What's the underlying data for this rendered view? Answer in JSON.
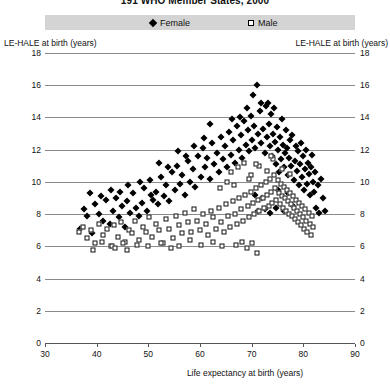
{
  "chart_data": {
    "type": "scatter",
    "title": "191 WHO Member States, 2000",
    "xlabel": "Life expectancy at birth (years)",
    "ylabel_left": "LE-HALE at birth (years)",
    "ylabel_right": "LE-HALE at birth (years)",
    "xlim": [
      30,
      90
    ],
    "ylim": [
      0,
      18
    ],
    "xticks": [
      30,
      40,
      50,
      60,
      70,
      80,
      90
    ],
    "yticks": [
      0,
      2,
      4,
      6,
      8,
      10,
      12,
      14,
      16,
      18
    ],
    "grid": "horizontal",
    "legend_position": "top",
    "legend": [
      {
        "label": "Female",
        "marker": "filled-diamond",
        "color": "#000000"
      },
      {
        "label": "Male",
        "marker": "open-square",
        "color": "#000000"
      }
    ],
    "series": [
      {
        "name": "Female",
        "marker": "filled-diamond",
        "points": [
          [
            37.5,
            8.3
          ],
          [
            38.2,
            7.9
          ],
          [
            39.0,
            6.8
          ],
          [
            39.6,
            8.6
          ],
          [
            40.4,
            8.0
          ],
          [
            41.2,
            7.6
          ],
          [
            41.9,
            8.9
          ],
          [
            42.5,
            7.4
          ],
          [
            43.1,
            8.2
          ],
          [
            43.8,
            9.0
          ],
          [
            44.3,
            7.8
          ],
          [
            44.9,
            8.5
          ],
          [
            45.4,
            7.2
          ],
          [
            45.9,
            8.8
          ],
          [
            46.5,
            8.1
          ],
          [
            47.0,
            9.3
          ],
          [
            47.6,
            8.4
          ],
          [
            48.1,
            7.9
          ],
          [
            48.7,
            8.7
          ],
          [
            49.2,
            9.6
          ],
          [
            49.8,
            8.2
          ],
          [
            50.3,
            10.1
          ],
          [
            50.9,
            8.9
          ],
          [
            51.4,
            9.4
          ],
          [
            51.9,
            8.6
          ],
          [
            52.4,
            10.3
          ],
          [
            53.0,
            9.1
          ],
          [
            53.5,
            9.8
          ],
          [
            54.0,
            8.8
          ],
          [
            54.6,
            10.6
          ],
          [
            55.1,
            9.5
          ],
          [
            55.6,
            11.0
          ],
          [
            56.1,
            9.9
          ],
          [
            56.6,
            10.4
          ],
          [
            57.1,
            9.2
          ],
          [
            57.6,
            11.3
          ],
          [
            58.1,
            10.0
          ],
          [
            58.6,
            10.8
          ],
          [
            59.1,
            9.7
          ],
          [
            59.6,
            11.6
          ],
          [
            60.1,
            10.3
          ],
          [
            60.5,
            12.1
          ],
          [
            61.0,
            10.9
          ],
          [
            61.4,
            11.5
          ],
          [
            61.9,
            10.2
          ],
          [
            62.3,
            12.4
          ],
          [
            62.8,
            11.1
          ],
          [
            63.2,
            11.8
          ],
          [
            63.6,
            10.6
          ],
          [
            64.0,
            12.8
          ],
          [
            64.4,
            11.4
          ],
          [
            64.8,
            12.2
          ],
          [
            65.2,
            10.9
          ],
          [
            65.6,
            13.1
          ],
          [
            66.0,
            11.7
          ],
          [
            66.4,
            12.6
          ],
          [
            66.8,
            11.2
          ],
          [
            67.1,
            13.5
          ],
          [
            67.5,
            12.0
          ],
          [
            67.9,
            12.9
          ],
          [
            68.2,
            11.5
          ],
          [
            68.6,
            13.8
          ],
          [
            68.9,
            12.3
          ],
          [
            69.2,
            13.2
          ],
          [
            69.5,
            11.9
          ],
          [
            69.8,
            14.1
          ],
          [
            70.1,
            12.6
          ],
          [
            70.4,
            13.5
          ],
          [
            70.7,
            12.1
          ],
          [
            71.0,
            16.0
          ],
          [
            71.3,
            13.0
          ],
          [
            71.6,
            14.4
          ],
          [
            71.9,
            12.4
          ],
          [
            72.2,
            13.3
          ],
          [
            72.5,
            11.8
          ],
          [
            72.8,
            14.7
          ],
          [
            73.0,
            12.8
          ],
          [
            73.3,
            13.6
          ],
          [
            73.5,
            12.2
          ],
          [
            73.8,
            14.2
          ],
          [
            74.0,
            11.6
          ],
          [
            74.2,
            13.0
          ],
          [
            74.5,
            12.5
          ],
          [
            74.7,
            11.1
          ],
          [
            74.9,
            13.4
          ],
          [
            75.1,
            12.0
          ],
          [
            75.3,
            10.6
          ],
          [
            75.5,
            12.8
          ],
          [
            75.7,
            11.4
          ],
          [
            75.9,
            13.9
          ],
          [
            76.1,
            12.3
          ],
          [
            76.3,
            10.9
          ],
          [
            76.5,
            11.8
          ],
          [
            76.7,
            13.2
          ],
          [
            76.9,
            12.1
          ],
          [
            77.1,
            10.4
          ],
          [
            77.3,
            11.5
          ],
          [
            77.5,
            12.6
          ],
          [
            77.7,
            11.0
          ],
          [
            77.9,
            12.9
          ],
          [
            78.1,
            10.1
          ],
          [
            78.3,
            11.3
          ],
          [
            78.5,
            12.2
          ],
          [
            78.7,
            10.7
          ],
          [
            78.9,
            11.9
          ],
          [
            79.1,
            9.8
          ],
          [
            79.3,
            11.1
          ],
          [
            79.5,
            12.4
          ],
          [
            79.7,
            10.3
          ],
          [
            79.9,
            11.6
          ],
          [
            80.1,
            9.5
          ],
          [
            80.3,
            10.8
          ],
          [
            80.5,
            12.0
          ],
          [
            80.7,
            9.9
          ],
          [
            80.9,
            11.2
          ],
          [
            81.1,
            10.5
          ],
          [
            81.3,
            9.2
          ],
          [
            81.5,
            10.9
          ],
          [
            81.7,
            11.7
          ],
          [
            81.9,
            10.0
          ],
          [
            82.1,
            9.4
          ],
          [
            82.3,
            10.6
          ],
          [
            82.5,
            8.4
          ],
          [
            82.8,
            9.8
          ],
          [
            83.1,
            8.1
          ],
          [
            83.4,
            10.2
          ],
          [
            83.8,
            9.0
          ],
          [
            84.2,
            8.2
          ],
          [
            70.3,
            15.4
          ],
          [
            71.8,
            14.9
          ],
          [
            69.0,
            14.6
          ],
          [
            67.8,
            14.0
          ],
          [
            66.2,
            13.9
          ],
          [
            73.2,
            14.9
          ],
          [
            74.4,
            14.6
          ],
          [
            62.0,
            13.6
          ],
          [
            60.8,
            12.7
          ],
          [
            58.9,
            12.2
          ],
          [
            57.3,
            11.6
          ],
          [
            55.8,
            11.9
          ],
          [
            53.8,
            10.9
          ],
          [
            52.0,
            11.2
          ],
          [
            50.5,
            9.2
          ],
          [
            48.4,
            10.0
          ],
          [
            46.0,
            9.8
          ],
          [
            44.6,
            9.4
          ],
          [
            42.8,
            9.5
          ],
          [
            40.8,
            9.1
          ],
          [
            38.8,
            9.3
          ],
          [
            36.8,
            7.1
          ],
          [
            71.2,
            8.2
          ],
          [
            72.6,
            8.3
          ],
          [
            73.6,
            8.1
          ],
          [
            74.8,
            8.4
          ],
          [
            76.2,
            8.2
          ],
          [
            78.0,
            8.5
          ],
          [
            70.6,
            9.2
          ],
          [
            72.0,
            9.0
          ],
          [
            75.0,
            9.5
          ],
          [
            77.0,
            9.3
          ]
        ]
      },
      {
        "name": "Male",
        "marker": "open-square",
        "points": [
          [
            36.5,
            6.9
          ],
          [
            37.4,
            7.2
          ],
          [
            38.1,
            6.5
          ],
          [
            38.9,
            7.0
          ],
          [
            39.7,
            6.2
          ],
          [
            40.5,
            7.4
          ],
          [
            41.3,
            6.7
          ],
          [
            42.0,
            7.1
          ],
          [
            42.7,
            6.0
          ],
          [
            43.4,
            7.3
          ],
          [
            44.1,
            6.6
          ],
          [
            44.8,
            7.5
          ],
          [
            45.5,
            6.3
          ],
          [
            46.2,
            7.0
          ],
          [
            46.9,
            6.8
          ],
          [
            47.5,
            7.6
          ],
          [
            48.2,
            6.4
          ],
          [
            48.9,
            7.2
          ],
          [
            49.5,
            6.9
          ],
          [
            50.2,
            7.8
          ],
          [
            50.8,
            6.6
          ],
          [
            51.5,
            7.4
          ],
          [
            52.1,
            7.0
          ],
          [
            52.8,
            6.2
          ],
          [
            53.4,
            7.7
          ],
          [
            54.0,
            7.1
          ],
          [
            54.7,
            6.5
          ],
          [
            55.3,
            7.9
          ],
          [
            55.9,
            7.3
          ],
          [
            56.5,
            6.8
          ],
          [
            57.1,
            8.1
          ],
          [
            57.7,
            7.5
          ],
          [
            58.3,
            6.9
          ],
          [
            58.9,
            8.3
          ],
          [
            59.4,
            7.6
          ],
          [
            60.0,
            7.0
          ],
          [
            60.5,
            8.0
          ],
          [
            61.1,
            7.4
          ],
          [
            61.6,
            6.7
          ],
          [
            62.1,
            8.2
          ],
          [
            62.6,
            7.8
          ],
          [
            63.1,
            7.1
          ],
          [
            63.6,
            8.4
          ],
          [
            64.1,
            7.5
          ],
          [
            64.6,
            6.9
          ],
          [
            65.0,
            8.6
          ],
          [
            65.5,
            7.9
          ],
          [
            65.9,
            7.2
          ],
          [
            66.4,
            8.8
          ],
          [
            66.8,
            8.0
          ],
          [
            67.2,
            7.4
          ],
          [
            67.6,
            9.0
          ],
          [
            68.0,
            8.3
          ],
          [
            68.4,
            7.6
          ],
          [
            68.8,
            9.2
          ],
          [
            69.2,
            8.5
          ],
          [
            69.5,
            7.8
          ],
          [
            69.9,
            9.4
          ],
          [
            70.2,
            8.7
          ],
          [
            70.5,
            8.0
          ],
          [
            70.9,
            9.6
          ],
          [
            71.2,
            8.9
          ],
          [
            71.5,
            8.2
          ],
          [
            71.8,
            9.8
          ],
          [
            72.1,
            9.0
          ],
          [
            72.4,
            8.4
          ],
          [
            72.7,
            10.0
          ],
          [
            73.0,
            9.2
          ],
          [
            73.3,
            8.5
          ],
          [
            73.5,
            10.2
          ],
          [
            73.8,
            9.4
          ],
          [
            74.0,
            8.7
          ],
          [
            74.3,
            10.4
          ],
          [
            74.5,
            9.6
          ],
          [
            74.7,
            8.9
          ],
          [
            75.0,
            10.1
          ],
          [
            75.2,
            9.3
          ],
          [
            75.4,
            8.6
          ],
          [
            75.6,
            9.9
          ],
          [
            75.8,
            9.1
          ],
          [
            76.0,
            8.4
          ],
          [
            76.2,
            9.7
          ],
          [
            76.4,
            9.0
          ],
          [
            76.6,
            8.2
          ],
          [
            76.8,
            9.5
          ],
          [
            77.0,
            8.8
          ],
          [
            77.2,
            8.0
          ],
          [
            77.4,
            9.3
          ],
          [
            77.6,
            8.6
          ],
          [
            77.8,
            7.9
          ],
          [
            78.0,
            9.1
          ],
          [
            78.2,
            8.4
          ],
          [
            78.4,
            7.7
          ],
          [
            78.6,
            8.9
          ],
          [
            78.8,
            8.2
          ],
          [
            79.0,
            7.5
          ],
          [
            79.2,
            8.7
          ],
          [
            79.4,
            8.0
          ],
          [
            79.6,
            7.3
          ],
          [
            79.8,
            8.5
          ],
          [
            80.0,
            7.8
          ],
          [
            80.2,
            7.1
          ],
          [
            80.4,
            8.3
          ],
          [
            80.6,
            7.6
          ],
          [
            80.8,
            6.9
          ],
          [
            81.0,
            8.1
          ],
          [
            81.2,
            7.4
          ],
          [
            81.4,
            6.7
          ],
          [
            81.6,
            7.9
          ],
          [
            81.8,
            7.2
          ],
          [
            67.0,
            6.1
          ],
          [
            68.1,
            6.3
          ],
          [
            69.0,
            5.9
          ],
          [
            70.0,
            6.2
          ],
          [
            71.0,
            5.6
          ],
          [
            64.2,
            6.0
          ],
          [
            62.5,
            6.3
          ],
          [
            60.2,
            6.1
          ],
          [
            58.0,
            6.4
          ],
          [
            56.0,
            6.0
          ],
          [
            54.3,
            5.9
          ],
          [
            52.5,
            6.2
          ],
          [
            50.0,
            6.0
          ],
          [
            47.8,
            6.1
          ],
          [
            45.0,
            6.2
          ],
          [
            43.0,
            6.0
          ],
          [
            41.0,
            6.3
          ],
          [
            39.2,
            5.8
          ],
          [
            43.5,
            5.9
          ],
          [
            45.8,
            5.8
          ],
          [
            66.0,
            10.6
          ],
          [
            67.4,
            10.9
          ],
          [
            68.6,
            11.2
          ],
          [
            69.8,
            10.4
          ],
          [
            71.4,
            11.0
          ],
          [
            72.9,
            10.7
          ],
          [
            74.1,
            11.4
          ],
          [
            75.9,
            10.8
          ],
          [
            77.5,
            10.5
          ],
          [
            73.7,
            11.6
          ],
          [
            70.8,
            11.1
          ],
          [
            69.4,
            10.2
          ],
          [
            66.6,
            9.8
          ],
          [
            65.2,
            10.0
          ],
          [
            63.8,
            9.6
          ]
        ]
      }
    ]
  }
}
